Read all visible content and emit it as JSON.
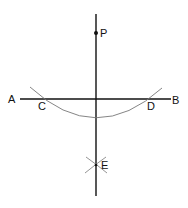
{
  "diagram": {
    "colors": {
      "line": "#111111",
      "arc": "#777777",
      "background": "#ffffff"
    },
    "points": {
      "P": {
        "label": "P",
        "x": 96,
        "y": 33
      },
      "A": {
        "label": "A",
        "x": 20,
        "y": 99
      },
      "B": {
        "label": "B",
        "x": 171,
        "y": 99
      },
      "C": {
        "label": "C",
        "x": 42,
        "y": 99
      },
      "D": {
        "label": "D",
        "x": 150,
        "y": 99
      },
      "E": {
        "label": "E",
        "x": 96,
        "y": 165
      }
    },
    "lines": [
      {
        "name": "line-AB",
        "from": "A",
        "to": "B"
      },
      {
        "name": "perpendicular-PE",
        "from": [
          96,
          14
        ],
        "to": [
          96,
          196
        ]
      }
    ],
    "arcs": [
      {
        "name": "arc-CD",
        "center": "P",
        "passes": [
          "C",
          "D"
        ]
      },
      {
        "name": "arc-from-C-at-E",
        "center": "C"
      },
      {
        "name": "arc-from-D-at-E",
        "center": "D"
      }
    ]
  }
}
